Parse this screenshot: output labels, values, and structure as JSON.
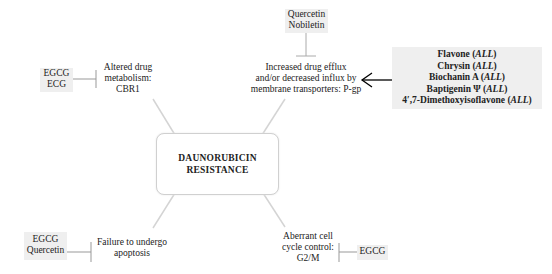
{
  "center": {
    "line1": "DAUNORUBICIN",
    "line2": "RESISTANCE"
  },
  "mechanisms": {
    "metabolism": {
      "line1": "Altered drug",
      "line2": "metabolism:",
      "line3": "CBR1"
    },
    "efflux": {
      "line1": "Increased drug efflux",
      "line2": "and/or decreased influx by",
      "line3": "membrane transporters: P-gp"
    },
    "apoptosis": {
      "line1": "Failure to undergo",
      "line2": "apoptosis"
    },
    "cell_cycle": {
      "line1": "Aberrant cell",
      "line2": "cycle control:",
      "line3": "G2/M"
    }
  },
  "inhibitors": {
    "metabolism": [
      "EGCG",
      "ECG"
    ],
    "efflux": [
      "Quercetin",
      "Nobiletin"
    ],
    "apoptosis": [
      "EGCG",
      "Quercetin"
    ],
    "cell_cycle": [
      "EGCG"
    ]
  },
  "flavonoids": {
    "items": [
      {
        "name": "Flavone",
        "note": "ALL"
      },
      {
        "name": "Chrysin",
        "note": "ALL"
      },
      {
        "name": "Biochanin A",
        "note": "ALL"
      },
      {
        "name": "Baptigenin Ψ",
        "note": "ALL"
      },
      {
        "name": "4′,7-Dimethoxyisoflavone",
        "note": "ALL"
      }
    ]
  },
  "colors": {
    "connector": "#d4d4d4",
    "inhibitor_line": "#999999",
    "arrow": "#000000",
    "shade": "#efefef"
  }
}
